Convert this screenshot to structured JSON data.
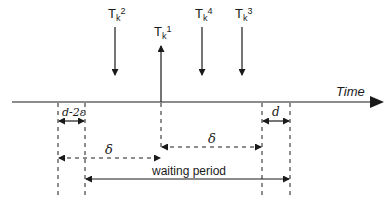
{
  "diagram": {
    "type": "timing-diagram",
    "axis_label": "Time",
    "events": [
      {
        "id": "Tk2",
        "base": "T",
        "sub": "k",
        "sup": "2",
        "direction": "down"
      },
      {
        "id": "Tk1",
        "base": "T",
        "sub": "k",
        "sup": "1",
        "direction": "up"
      },
      {
        "id": "Tk4",
        "base": "T",
        "sub": "k",
        "sup": "4",
        "direction": "down"
      },
      {
        "id": "Tk3",
        "base": "T",
        "sub": "k",
        "sup": "3",
        "direction": "down"
      }
    ],
    "intervals": {
      "d_minus_2eps": "d-2ε",
      "d": "d",
      "delta_left": "δ",
      "delta_right": "δ",
      "waiting_period": "waiting period"
    }
  },
  "colors": {
    "stroke": "#1a1a1a",
    "background": "#ffffff"
  }
}
